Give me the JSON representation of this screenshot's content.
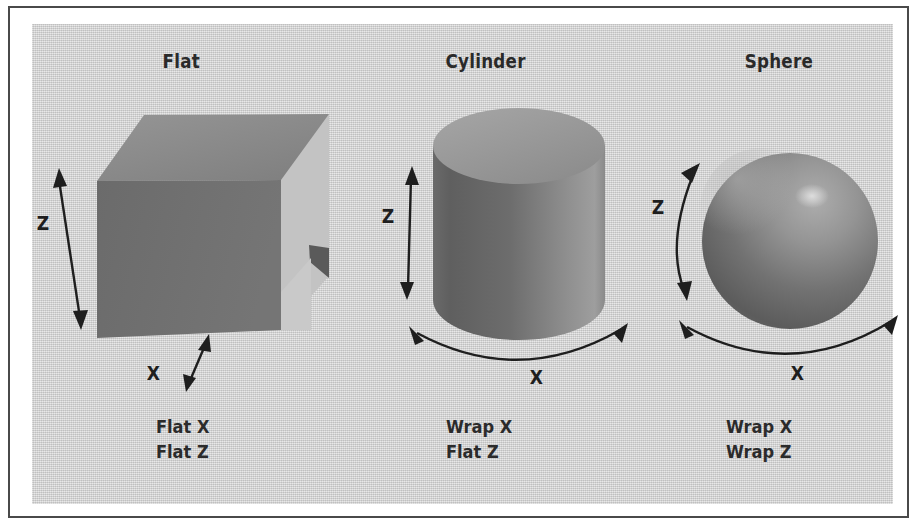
{
  "figure": {
    "panels": [
      {
        "id": "flat",
        "title": "Flat",
        "shape": "cube",
        "caption_line1": "Flat X",
        "caption_line2": "Flat Z",
        "axes": [
          {
            "name": "z-axis",
            "label": "Z",
            "arrow": "straight-double-vertical"
          },
          {
            "name": "x-axis",
            "label": "X",
            "arrow": "straight-double-diagonal"
          }
        ]
      },
      {
        "id": "cylinder",
        "title": "Cylinder",
        "shape": "cylinder",
        "caption_line1": "Wrap X",
        "caption_line2": "Flat Z",
        "axes": [
          {
            "name": "z-axis",
            "label": "Z",
            "arrow": "straight-double-vertical"
          },
          {
            "name": "x-axis",
            "label": "X",
            "arrow": "curved-double-arc"
          }
        ]
      },
      {
        "id": "sphere",
        "title": "Sphere",
        "shape": "sphere",
        "caption_line1": "Wrap X",
        "caption_line2": "Wrap Z",
        "axes": [
          {
            "name": "z-axis",
            "label": "Z",
            "arrow": "curved-double-arc-vertical"
          },
          {
            "name": "x-axis",
            "label": "X",
            "arrow": "curved-double-arc"
          }
        ]
      }
    ],
    "colors": {
      "plate_background": "#d2d2d2",
      "page_background": "#ffffff",
      "border": "#4a4a4a",
      "text": "#2a2a2a",
      "arrow": "#1e1e1e",
      "cube_front": "#6e6e6e",
      "cube_top": "#8a8a8a",
      "cube_side": "#c0c0c0",
      "cylinder_top": "#9a9a9a",
      "cylinder_body_dark": "#5f5f5f",
      "cylinder_body_light": "#9e9e9e",
      "sphere_dark": "#5a5a5a",
      "sphere_light": "#a8a8a8",
      "sphere_highlight": "#d8d8d8"
    }
  }
}
